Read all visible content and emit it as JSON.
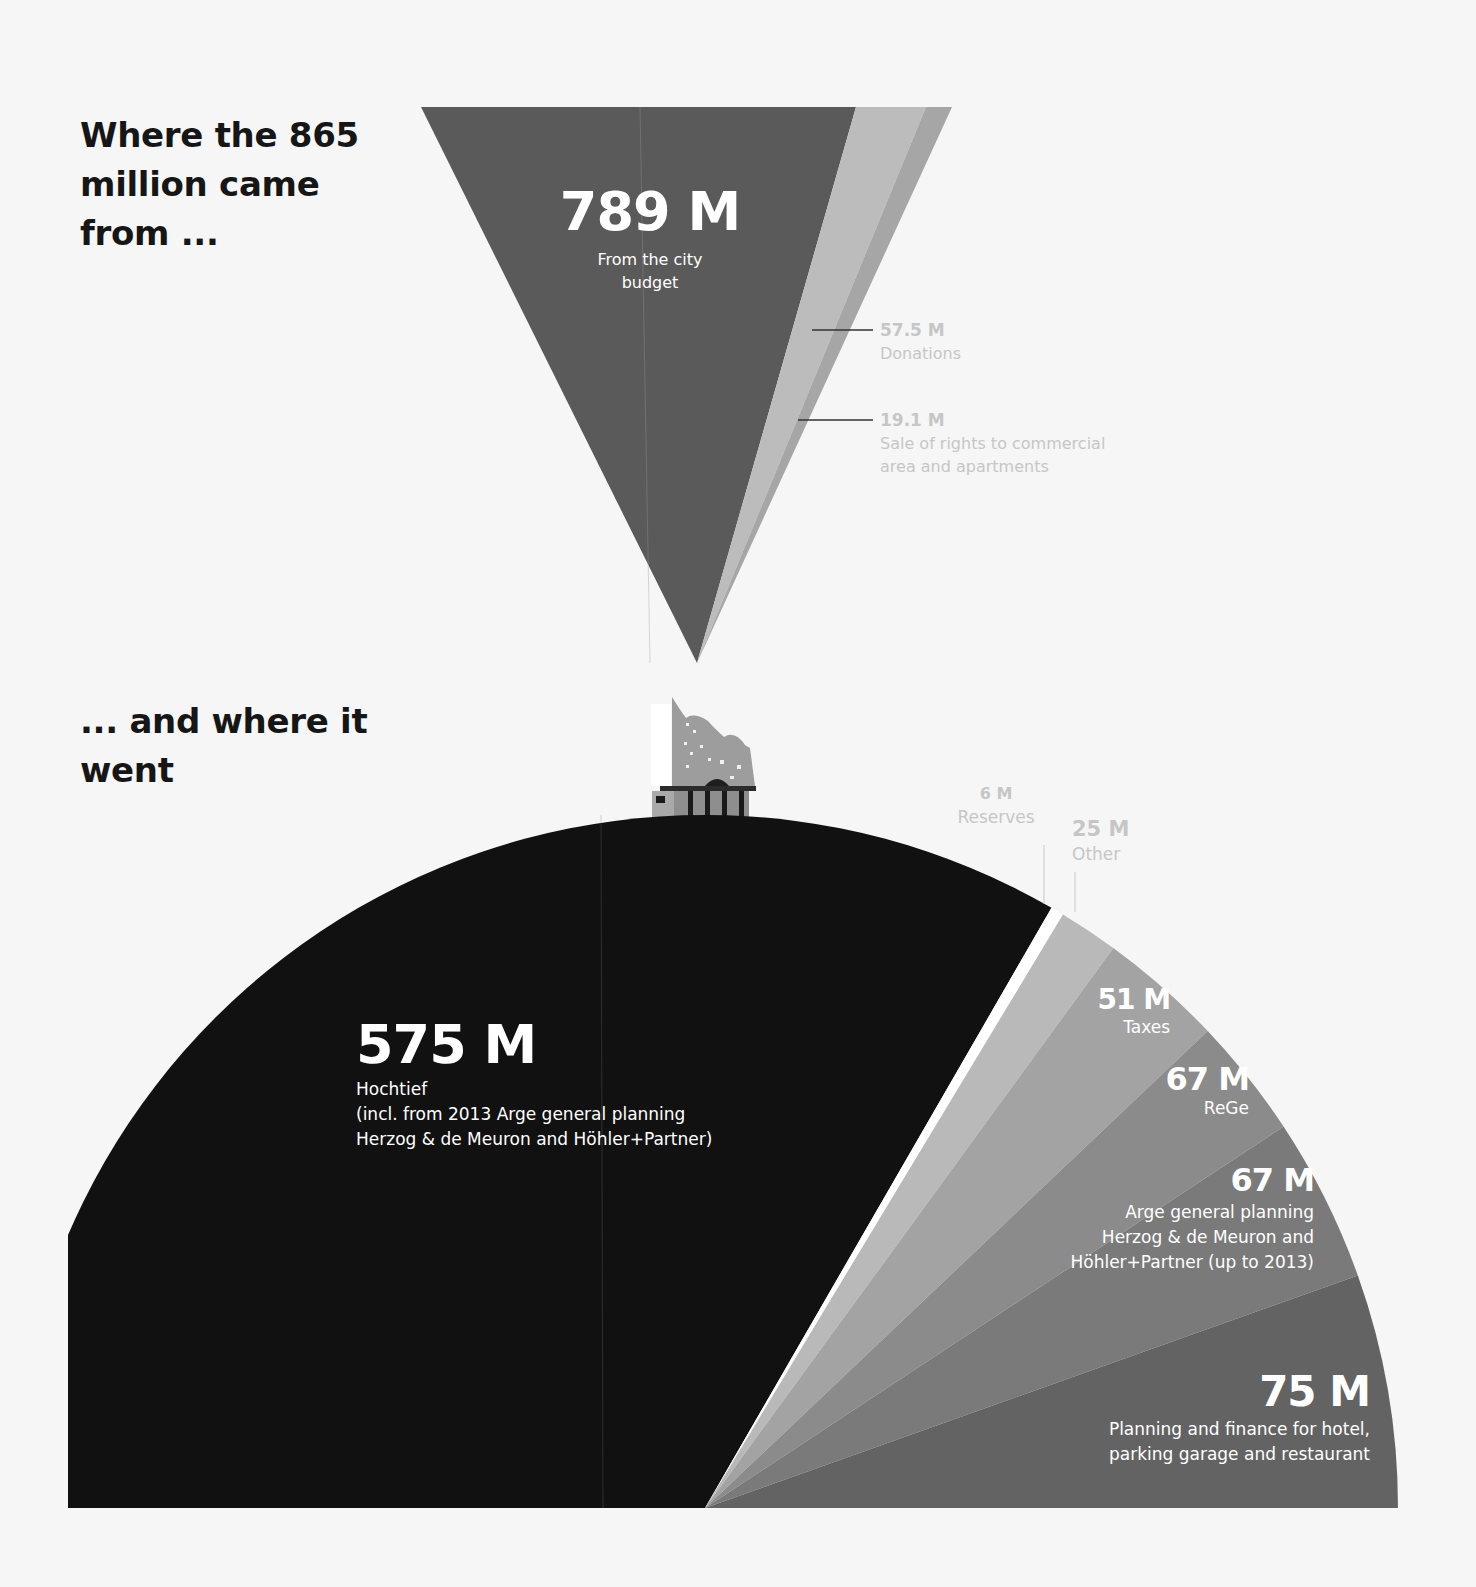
{
  "titles": {
    "top": "Where the 865 million came from ...",
    "bottom": "... and where it went"
  },
  "colors": {
    "background": "#f6f6f6",
    "city_budget": "#5a5a5a",
    "donations": "#bcbcbc",
    "sale_rights": "#a6a6a6",
    "hochtief": "#111111",
    "reserves": "#ffffff",
    "other": "#b9b9b9",
    "taxes": "#a3a3a3",
    "rege": "#8b8b8b",
    "arge": "#7a7a7a",
    "planning": "#636363",
    "callout_text": "#c6c6c6"
  },
  "sources": {
    "city": {
      "value": "789 M",
      "label": "From the city budget"
    },
    "donations": {
      "value": "57.5 M",
      "label": "Donations"
    },
    "sale": {
      "value": "19.1 M",
      "label": "Sale of rights to commercial area and apartments"
    }
  },
  "uses": {
    "hochtief": {
      "value": "575 M",
      "label": "Hochtief",
      "note1": "(incl. from 2013 Arge general planning",
      "note2": "Herzog & de Meuron and Höhler+Partner)"
    },
    "reserves": {
      "value": "6 M",
      "label": "Reserves"
    },
    "other": {
      "value": "25 M",
      "label": "Other"
    },
    "taxes": {
      "value": "51 M",
      "label": "Taxes"
    },
    "rege": {
      "value": "67 M",
      "label": "ReGe"
    },
    "arge": {
      "value": "67 M",
      "label1": "Arge general planning",
      "label2": "Herzog & de Meuron and",
      "label3": "Höhler+Partner (up to 2013)"
    },
    "planning": {
      "value": "75 M",
      "label1": "Planning and finance for hotel,",
      "label2": "parking garage and restaurant"
    }
  },
  "chart_data": [
    {
      "type": "funnel",
      "title": "Where the 865 million came from ...",
      "categories": [
        "From the city budget",
        "Donations",
        "Sale of rights to commercial area and apartments"
      ],
      "values": [
        789,
        57.5,
        19.1
      ],
      "unit": "M EUR",
      "total": 865
    },
    {
      "type": "pie",
      "title": "... and where it went",
      "categories": [
        "Hochtief (incl. from 2013 Arge general planning Herzog & de Meuron and Höhler+Partner)",
        "Reserves",
        "Other",
        "Taxes",
        "ReGe",
        "Arge general planning Herzog & de Meuron and Höhler+Partner (up to 2013)",
        "Planning and finance for hotel, parking garage and restaurant"
      ],
      "values": [
        575,
        6,
        25,
        51,
        67,
        67,
        75
      ],
      "unit": "M EUR",
      "layout": "half-pie (semicircle), slices ordered left-to-right"
    }
  ]
}
